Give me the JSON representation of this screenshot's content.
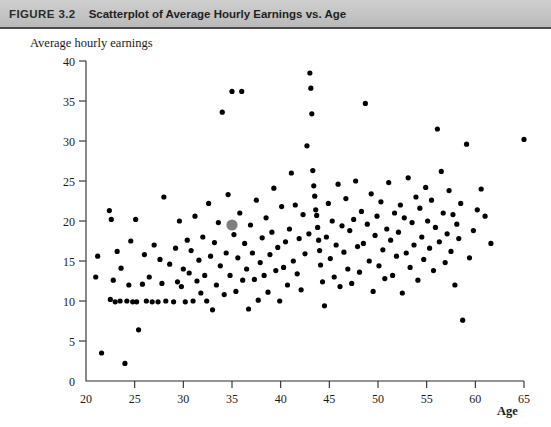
{
  "header": {
    "figure_number": "FIGURE 3.2",
    "title": "Scatterplot of Average Hourly Earnings vs. Age",
    "background_color": "#c6c6c6",
    "rule_color": "#4a4a4a"
  },
  "chart_data": {
    "type": "scatter",
    "title": "Scatterplot of Average Hourly Earnings vs. Age",
    "xlabel": "Age",
    "ylabel": "Average hourly earnings",
    "xlim": [
      20,
      65
    ],
    "ylim": [
      0,
      40
    ],
    "xticks": [
      20,
      25,
      30,
      35,
      40,
      45,
      50,
      55,
      60,
      65
    ],
    "yticks": [
      0,
      5,
      10,
      15,
      20,
      25,
      30,
      35,
      40
    ],
    "grid": false,
    "legend": null,
    "point_color": "#000000",
    "highlight_color": "#7f7f7f",
    "series": [
      {
        "name": "Highlighted observation",
        "color": "#7f7f7f",
        "marker_size": 5.6,
        "points": [
          [
            35.0,
            19.5
          ]
        ]
      },
      {
        "name": "Average hourly earnings",
        "color": "#000000",
        "marker_size": 2.6,
        "points": [
          [
            21.0,
            13.0
          ],
          [
            21.2,
            15.6
          ],
          [
            21.6,
            3.5
          ],
          [
            22.4,
            21.3
          ],
          [
            22.5,
            10.2
          ],
          [
            22.6,
            20.2
          ],
          [
            22.8,
            12.6
          ],
          [
            23.0,
            9.9
          ],
          [
            23.2,
            16.2
          ],
          [
            23.5,
            10.0
          ],
          [
            23.6,
            14.1
          ],
          [
            24.0,
            2.2
          ],
          [
            24.2,
            10.0
          ],
          [
            24.4,
            12.0
          ],
          [
            24.6,
            17.5
          ],
          [
            24.8,
            9.9
          ],
          [
            25.1,
            20.2
          ],
          [
            25.2,
            9.9
          ],
          [
            25.4,
            6.4
          ],
          [
            25.8,
            12.1
          ],
          [
            26.0,
            15.8
          ],
          [
            26.2,
            10.0
          ],
          [
            26.5,
            13.0
          ],
          [
            26.8,
            9.9
          ],
          [
            27.0,
            17.0
          ],
          [
            27.4,
            9.9
          ],
          [
            27.6,
            15.2
          ],
          [
            27.8,
            12.2
          ],
          [
            28.0,
            23.0
          ],
          [
            28.2,
            10.0
          ],
          [
            28.6,
            14.6
          ],
          [
            29.0,
            9.9
          ],
          [
            29.2,
            16.6
          ],
          [
            29.4,
            12.4
          ],
          [
            29.6,
            20.0
          ],
          [
            29.8,
            11.8
          ],
          [
            30.0,
            14.0
          ],
          [
            30.2,
            9.9
          ],
          [
            30.4,
            17.6
          ],
          [
            30.6,
            13.5
          ],
          [
            30.8,
            16.3
          ],
          [
            31.0,
            10.0
          ],
          [
            31.2,
            20.6
          ],
          [
            31.4,
            12.5
          ],
          [
            31.6,
            15.1
          ],
          [
            31.8,
            11.0
          ],
          [
            32.0,
            18.0
          ],
          [
            32.2,
            13.2
          ],
          [
            32.4,
            10.0
          ],
          [
            32.6,
            22.2
          ],
          [
            32.8,
            15.6
          ],
          [
            33.0,
            8.9
          ],
          [
            33.2,
            17.3
          ],
          [
            33.4,
            12.0
          ],
          [
            33.6,
            19.8
          ],
          [
            33.8,
            14.4
          ],
          [
            34.0,
            33.6
          ],
          [
            34.2,
            10.8
          ],
          [
            34.4,
            16.0
          ],
          [
            34.6,
            23.3
          ],
          [
            34.8,
            13.2
          ],
          [
            35.0,
            36.2
          ],
          [
            35.2,
            18.3
          ],
          [
            35.4,
            11.2
          ],
          [
            35.6,
            15.4
          ],
          [
            35.8,
            21.0
          ],
          [
            36.0,
            36.2
          ],
          [
            36.1,
            12.6
          ],
          [
            36.3,
            17.2
          ],
          [
            36.5,
            14.0
          ],
          [
            36.7,
            9.0
          ],
          [
            36.9,
            19.5
          ],
          [
            37.1,
            16.0
          ],
          [
            37.3,
            12.7
          ],
          [
            37.5,
            22.6
          ],
          [
            37.7,
            10.1
          ],
          [
            37.9,
            14.8
          ],
          [
            38.1,
            17.9
          ],
          [
            38.3,
            13.2
          ],
          [
            38.5,
            20.4
          ],
          [
            38.7,
            11.1
          ],
          [
            38.9,
            15.8
          ],
          [
            39.1,
            18.6
          ],
          [
            39.3,
            24.1
          ],
          [
            39.5,
            13.8
          ],
          [
            39.7,
            16.7
          ],
          [
            39.9,
            10.0
          ],
          [
            40.1,
            21.8
          ],
          [
            40.3,
            14.2
          ],
          [
            40.5,
            17.4
          ],
          [
            40.7,
            12.0
          ],
          [
            40.9,
            19.0
          ],
          [
            41.1,
            26.0
          ],
          [
            41.3,
            15.0
          ],
          [
            41.5,
            22.0
          ],
          [
            41.7,
            13.4
          ],
          [
            41.9,
            17.8
          ],
          [
            42.1,
            11.4
          ],
          [
            42.3,
            20.8
          ],
          [
            42.5,
            15.9
          ],
          [
            42.7,
            29.4
          ],
          [
            42.9,
            18.4
          ],
          [
            43.0,
            38.5
          ],
          [
            43.1,
            36.6
          ],
          [
            43.2,
            33.4
          ],
          [
            43.3,
            26.3
          ],
          [
            43.4,
            24.4
          ],
          [
            43.5,
            23.1
          ],
          [
            43.6,
            21.4
          ],
          [
            43.7,
            20.7
          ],
          [
            43.8,
            19.2
          ],
          [
            43.9,
            17.6
          ],
          [
            44.0,
            16.3
          ],
          [
            44.1,
            14.5
          ],
          [
            44.3,
            12.4
          ],
          [
            44.5,
            9.4
          ],
          [
            44.7,
            18.0
          ],
          [
            44.9,
            22.2
          ],
          [
            45.1,
            15.3
          ],
          [
            45.3,
            20.0
          ],
          [
            45.5,
            13.0
          ],
          [
            45.7,
            17.0
          ],
          [
            45.9,
            24.6
          ],
          [
            46.1,
            11.8
          ],
          [
            46.3,
            19.4
          ],
          [
            46.5,
            16.1
          ],
          [
            46.7,
            22.8
          ],
          [
            46.9,
            14.0
          ],
          [
            47.1,
            18.8
          ],
          [
            47.3,
            12.2
          ],
          [
            47.5,
            20.2
          ],
          [
            47.7,
            25.0
          ],
          [
            47.9,
            16.8
          ],
          [
            48.1,
            13.6
          ],
          [
            48.3,
            21.2
          ],
          [
            48.5,
            17.2
          ],
          [
            48.7,
            34.7
          ],
          [
            48.9,
            19.6
          ],
          [
            49.1,
            15.0
          ],
          [
            49.3,
            23.4
          ],
          [
            49.5,
            11.2
          ],
          [
            49.7,
            18.2
          ],
          [
            49.9,
            20.6
          ],
          [
            50.1,
            14.4
          ],
          [
            50.3,
            22.4
          ],
          [
            50.5,
            16.4
          ],
          [
            50.7,
            12.8
          ],
          [
            50.9,
            19.0
          ],
          [
            51.1,
            24.8
          ],
          [
            51.3,
            17.6
          ],
          [
            51.5,
            13.2
          ],
          [
            51.7,
            21.0
          ],
          [
            51.9,
            15.6
          ],
          [
            52.1,
            18.6
          ],
          [
            52.3,
            22.0
          ],
          [
            52.5,
            11.0
          ],
          [
            52.7,
            20.4
          ],
          [
            52.9,
            16.0
          ],
          [
            53.1,
            25.4
          ],
          [
            53.3,
            14.2
          ],
          [
            53.5,
            19.8
          ],
          [
            53.7,
            17.0
          ],
          [
            53.9,
            23.0
          ],
          [
            54.1,
            12.6
          ],
          [
            54.3,
            21.6
          ],
          [
            54.5,
            18.0
          ],
          [
            54.7,
            15.2
          ],
          [
            54.9,
            24.2
          ],
          [
            55.1,
            20.0
          ],
          [
            55.3,
            16.6
          ],
          [
            55.5,
            22.6
          ],
          [
            55.7,
            13.8
          ],
          [
            55.9,
            19.2
          ],
          [
            56.1,
            31.5
          ],
          [
            56.3,
            17.4
          ],
          [
            56.5,
            26.2
          ],
          [
            56.7,
            21.0
          ],
          [
            56.9,
            14.8
          ],
          [
            57.1,
            18.4
          ],
          [
            57.3,
            23.8
          ],
          [
            57.5,
            16.2
          ],
          [
            57.7,
            20.8
          ],
          [
            57.9,
            12.0
          ],
          [
            58.1,
            19.6
          ],
          [
            58.3,
            17.8
          ],
          [
            58.5,
            22.2
          ],
          [
            58.7,
            7.6
          ],
          [
            59.1,
            29.6
          ],
          [
            59.4,
            15.4
          ],
          [
            59.8,
            18.8
          ],
          [
            60.2,
            21.4
          ],
          [
            60.6,
            24.0
          ],
          [
            61.0,
            20.6
          ],
          [
            61.6,
            17.2
          ],
          [
            65.0,
            30.2
          ]
        ]
      }
    ]
  }
}
